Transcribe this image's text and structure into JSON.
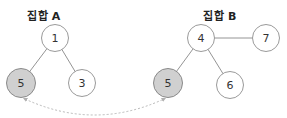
{
  "sets": [
    {
      "label": "집합 A",
      "label_pos": [
        44,
        8
      ],
      "nodes": [
        {
          "id": "A1",
          "value": "1",
          "x": 55,
          "y": 38,
          "r": 14,
          "shared": false
        },
        {
          "id": "A5",
          "value": "5",
          "x": 21,
          "y": 83,
          "r": 15,
          "shared": true
        },
        {
          "id": "A3",
          "value": "3",
          "x": 82,
          "y": 83,
          "r": 14,
          "shared": false
        }
      ],
      "edges": [
        [
          "A1",
          "A5"
        ],
        [
          "A1",
          "A3"
        ]
      ]
    },
    {
      "label": "집합 B",
      "label_pos": [
        220,
        8
      ],
      "nodes": [
        {
          "id": "B4",
          "value": "4",
          "x": 201,
          "y": 38,
          "r": 14,
          "shared": false
        },
        {
          "id": "B7",
          "value": "7",
          "x": 266,
          "y": 38,
          "r": 14,
          "shared": false
        },
        {
          "id": "B5",
          "value": "5",
          "x": 168,
          "y": 83,
          "r": 15,
          "shared": true
        },
        {
          "id": "B6",
          "value": "6",
          "x": 230,
          "y": 85,
          "r": 14,
          "shared": false
        }
      ],
      "edges": [
        [
          "B4",
          "B7"
        ],
        [
          "B4",
          "B5"
        ],
        [
          "B4",
          "B6"
        ]
      ]
    }
  ],
  "link": {
    "from": "A5",
    "to": "B5",
    "style": "dashed-curved-double-arrow"
  },
  "colors": {
    "shared_fill": "#d0d0d0",
    "stroke": "#9a9a9a",
    "link": "#b0b0b0"
  }
}
